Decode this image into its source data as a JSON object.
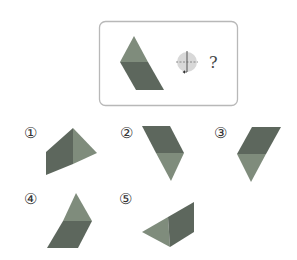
{
  "question": {
    "prompt_mark": "?",
    "rotation_icon": "rotate-about-vertical-axis-icon"
  },
  "colors": {
    "light_face": "#7f8c7c",
    "dark_face": "#5d675d",
    "frame": "#b8b8b8",
    "icon_fill": "#d8d8d8",
    "icon_line": "#555555"
  },
  "options": [
    {
      "label": "①"
    },
    {
      "label": "②"
    },
    {
      "label": "③"
    },
    {
      "label": "④"
    },
    {
      "label": "⑤"
    }
  ]
}
